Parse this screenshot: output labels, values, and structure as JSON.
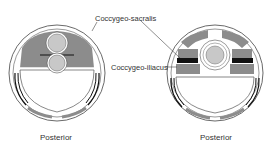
{
  "labels": {
    "sacralis": "Coccygeo-sacralis",
    "iliacus": "Coccygeo-iliacus",
    "left_caption": "Posterior",
    "right_caption": "Posterior"
  },
  "colors": {
    "muscle": "#8c8c8c",
    "organ": "#c8c8c8",
    "dark_band": "#111111",
    "outline": "#333333"
  }
}
